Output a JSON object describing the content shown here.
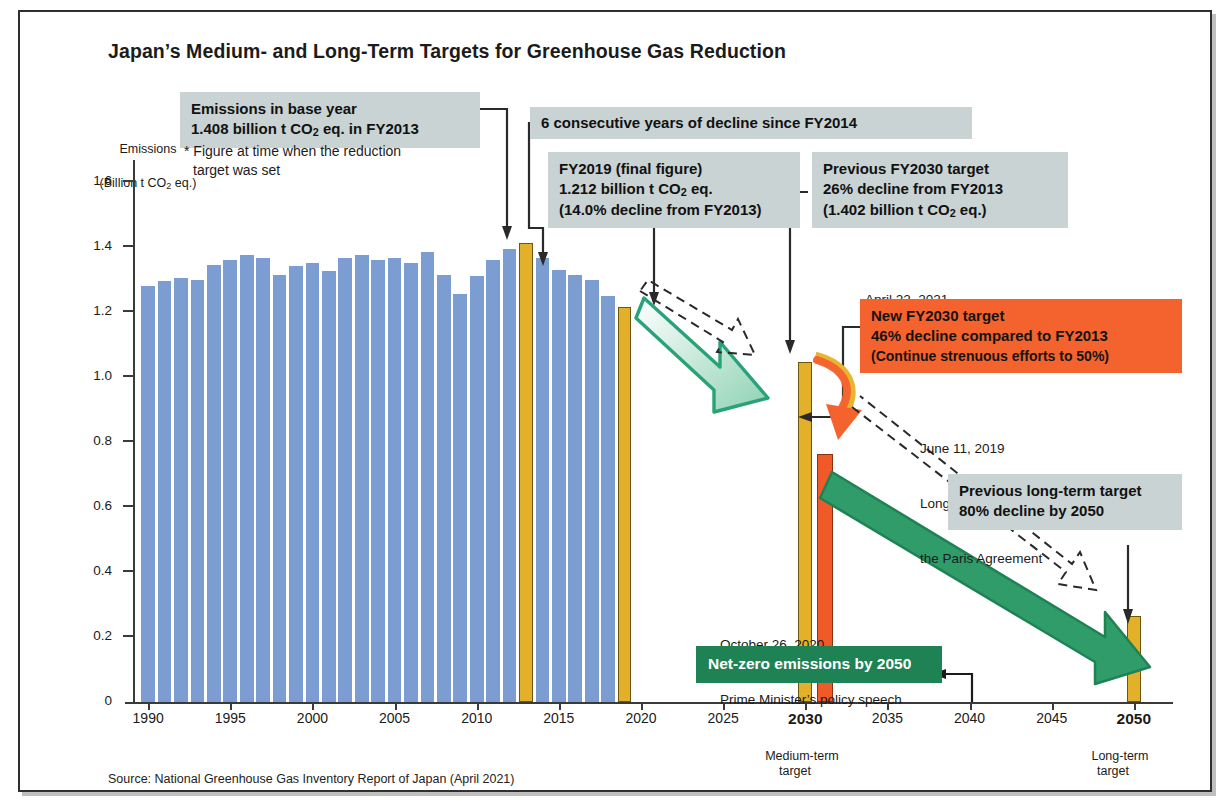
{
  "title": "Japan’s Medium- and Long-Term Targets for Greenhouse Gas Reduction",
  "source": "Source: National Greenhouse Gas Inventory Report of Japan (April 2021)",
  "axis": {
    "y_title_line1": "Emissions",
    "y_title_line2_pre": "(Billion t CO",
    "y_title_line2_sub": "2",
    "y_title_line2_post": " eq.)",
    "y_ticks": [
      "1.6",
      "1.4",
      "1.2",
      "1.0",
      "0.8",
      "0.6",
      "0.4",
      "0.2",
      "0"
    ],
    "x_ticks": [
      "1990",
      "1995",
      "2000",
      "2005",
      "2010",
      "2015",
      "2020",
      "2025",
      "2030",
      "2035",
      "2040",
      "2045",
      "2050"
    ],
    "medium_caption_line1": "Medium-term",
    "medium_caption_line2": "target",
    "long_caption_line1": "Long-term",
    "long_caption_line2": "target"
  },
  "callouts": {
    "base_year": {
      "line1": "Emissions in base year",
      "line2_pre": "1.408 billion t CO",
      "line2_sub": "2",
      "line2_post": " eq. in FY2013",
      "footnote_line1": "* Figure at time when the reduction",
      "footnote_line2": "target was set"
    },
    "six_years": {
      "line1": "6 consecutive years of decline since FY2014"
    },
    "fy2019": {
      "line1": "FY2019 (final figure)",
      "line2_pre": "1.212 billion t CO",
      "line2_sub": "2",
      "line2_post": " eq.",
      "line3": "(14.0% decline from FY2013)"
    },
    "prev_2030": {
      "line1": "Previous FY2030 target",
      "line2": "26% decline from FY2013",
      "line3_pre": "(1.402 billion t CO",
      "line3_sub": "2",
      "line3_post": " eq.)"
    },
    "april_note": {
      "line1": "April 22, 2021",
      "line2": "GW Prevention HQ / Climate Summit"
    },
    "new_2030": {
      "line1": "New FY2030 target",
      "line2": "46% decline compared to FY2013",
      "line3": "(Continue strenuous efforts to 50%)"
    },
    "june_note": {
      "line1": "June 11, 2019",
      "line2": "Long-term strategy under",
      "line3": "the Paris Agreement"
    },
    "prev_long": {
      "line1": "Previous long-term target",
      "line2": "80% decline by 2050"
    },
    "october_note": {
      "line1": "October 26, 2020",
      "line2": "Prime Minister’s policy speech"
    },
    "net_zero": {
      "line1": "Net-zero emissions by 2050"
    }
  },
  "colors": {
    "bar_blue": "#7b9dd2",
    "bar_gold": "#e3b129",
    "bar_orange": "#f05a28",
    "callout_gray": "#c9d3d3",
    "highlight_orange": "#f4622e",
    "green": "#1f8254",
    "green_arrow": "#3aab7e"
  },
  "chart_data": {
    "type": "bar",
    "title": "Japan’s Medium- and Long-Term Targets for Greenhouse Gas Reduction",
    "xlabel": "",
    "ylabel": "Emissions (Billion t CO2 eq.)",
    "ylim": [
      0,
      1.7
    ],
    "xlim": [
      1989,
      2052
    ],
    "grid": false,
    "legend": "none",
    "categories": [
      1990,
      1991,
      1992,
      1993,
      1994,
      1995,
      1996,
      1997,
      1998,
      1999,
      2000,
      2001,
      2002,
      2003,
      2004,
      2005,
      2006,
      2007,
      2008,
      2009,
      2010,
      2011,
      2012,
      2013,
      2014,
      2015,
      2016,
      2017,
      2018,
      2019,
      2030,
      2050
    ],
    "values": [
      1.275,
      1.29,
      1.3,
      1.295,
      1.34,
      1.355,
      1.37,
      1.36,
      1.31,
      1.335,
      1.345,
      1.32,
      1.36,
      1.37,
      1.355,
      1.36,
      1.345,
      1.38,
      1.31,
      1.25,
      1.305,
      1.355,
      1.39,
      1.408,
      1.362,
      1.325,
      1.31,
      1.295,
      1.245,
      1.212,
      1.042,
      0.264
    ],
    "bar_colors": [
      "blue",
      "blue",
      "blue",
      "blue",
      "blue",
      "blue",
      "blue",
      "blue",
      "blue",
      "blue",
      "blue",
      "blue",
      "blue",
      "blue",
      "blue",
      "blue",
      "blue",
      "blue",
      "blue",
      "blue",
      "blue",
      "blue",
      "blue",
      "gold",
      "blue",
      "blue",
      "blue",
      "blue",
      "blue",
      "gold",
      "gold",
      "gold"
    ],
    "extra_series": [
      {
        "name": "New FY2030 target (46% decline)",
        "x": 2031,
        "value": 0.76,
        "color": "orange"
      }
    ],
    "annotations": [
      {
        "text": "Emissions in base year 1.408 billion t CO2 eq. in FY2013",
        "points_to": 2013
      },
      {
        "text": "6 consecutive years of decline since FY2014",
        "points_to": 2014
      },
      {
        "text": "FY2019 (final figure) 1.212 billion t CO2 eq. (14.0% decline from FY2013)",
        "points_to": 2019
      },
      {
        "text": "Previous FY2030 target 26% decline from FY2013 (1.402 billion t CO2 eq.)",
        "points_to": 2030
      },
      {
        "text": "New FY2030 target 46% decline compared to FY2013 (Continue strenuous efforts to 50%)",
        "points_to": 2030
      },
      {
        "text": "Previous long-term target 80% decline by 2050",
        "points_to": 2050
      },
      {
        "text": "Net-zero emissions by 2050",
        "points_to": 2050
      }
    ]
  }
}
